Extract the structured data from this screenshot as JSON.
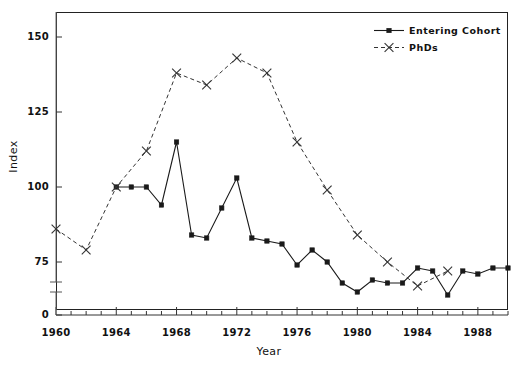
{
  "chart_data": {
    "type": "line",
    "title": "",
    "xlabel": "Year",
    "ylabel": "Index",
    "xlim": [
      1960,
      1990
    ],
    "ylim": [
      0,
      160
    ],
    "y_axis_break": {
      "present": true,
      "from": 0,
      "to": 68
    },
    "grid": false,
    "legend_position": "top-right",
    "yticks": [
      150,
      125,
      100,
      75,
      0
    ],
    "xticks": [
      1960,
      1964,
      1968,
      1972,
      1976,
      1980,
      1984,
      1988
    ],
    "xtick_minor_step": 1,
    "series": [
      {
        "name": "Entering Cohort",
        "style": "solid",
        "marker": "square",
        "color": "#1a1a1a",
        "x": [
          1964,
          1965,
          1966,
          1967,
          1968,
          1969,
          1970,
          1971,
          1972,
          1973,
          1974,
          1975,
          1976,
          1977,
          1978,
          1979,
          1980,
          1981,
          1982,
          1983,
          1984,
          1985,
          1986,
          1987,
          1988,
          1989,
          1990
        ],
        "y": [
          100,
          100,
          100,
          94,
          115,
          84,
          83,
          93,
          103,
          83,
          82,
          81,
          74,
          79,
          75,
          68,
          65,
          69,
          68,
          68,
          73,
          72,
          64,
          72,
          71,
          73,
          73
        ]
      },
      {
        "name": "PhDs",
        "style": "dashed",
        "marker": "x",
        "color": "#333333",
        "x": [
          1960,
          1962,
          1964,
          1966,
          1968,
          1970,
          1972,
          1974,
          1976,
          1978,
          1980,
          1982,
          1984,
          1986
        ],
        "y": [
          86,
          79,
          100,
          112,
          138,
          134,
          143,
          138,
          115,
          99,
          84,
          75,
          67,
          72
        ]
      }
    ]
  },
  "legend": {
    "items": [
      {
        "label": "Entering Cohort"
      },
      {
        "label": "PhDs"
      }
    ]
  },
  "axes": {
    "y_label": "Index",
    "x_label": "Year",
    "y_tick_labels": [
      "150",
      "125",
      "100",
      "75",
      "0"
    ],
    "x_tick_labels": [
      "1960",
      "1964",
      "1968",
      "1972",
      "1976",
      "1980",
      "1984",
      "1988"
    ]
  }
}
